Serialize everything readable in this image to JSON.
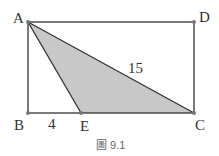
{
  "figure": {
    "caption": "圖 9.1",
    "points": {
      "A": "A",
      "B": "B",
      "C": "C",
      "D": "D",
      "E": "E"
    },
    "measures": {
      "AC": "15",
      "BE": "4"
    },
    "colors": {
      "line": "#333333",
      "fill": "#cccccc",
      "point": "#777777"
    }
  }
}
